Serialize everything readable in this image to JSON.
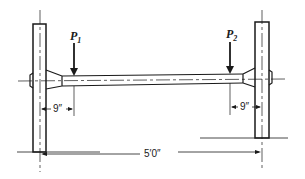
{
  "diagram": {
    "type": "mechanical-axle-drawing",
    "loads": [
      {
        "label": "P",
        "subscript": "1"
      },
      {
        "label": "P",
        "subscript": "2"
      }
    ],
    "dimensions": {
      "left_offset": "9″",
      "right_offset": "9″",
      "overall_span": "5′0″"
    },
    "colors": {
      "line": "#1a1a1a",
      "background": "#ffffff"
    }
  }
}
